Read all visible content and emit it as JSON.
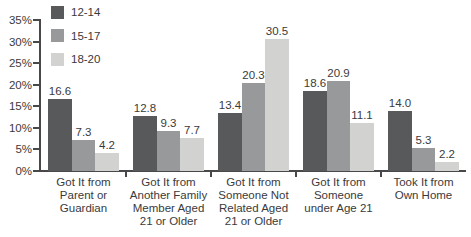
{
  "chart_data": {
    "type": "bar",
    "title": "",
    "xlabel": "",
    "ylabel": "",
    "ylim": [
      0,
      35
    ],
    "ytick_step": 5,
    "ytick_labels": [
      "0%",
      "5%",
      "10%",
      "15%",
      "20%",
      "25%",
      "30%",
      "35%"
    ],
    "grid": false,
    "legend_position": "top-left",
    "categories": [
      "Got It from\nParent or\nGuardian",
      "Got It from\nAnother Family\nMember Aged\n21 or Older",
      "Got It from\nSomeone Not\nRelated Aged\n21 or Older",
      "Got It from\nSomeone\nunder Age 21",
      "Took It from\nOwn Home"
    ],
    "series": [
      {
        "name": "12-14",
        "color": "#58595b",
        "values": [
          16.6,
          12.8,
          13.4,
          18.6,
          14.0
        ],
        "labels": [
          "16.6",
          "12.8",
          "13.4",
          "18.6",
          "14.0"
        ]
      },
      {
        "name": "15-17",
        "color": "#98999b",
        "values": [
          7.3,
          9.3,
          20.3,
          20.9,
          5.3
        ],
        "labels": [
          "7.3",
          "9.3",
          "20.3",
          "20.9",
          "5.3"
        ]
      },
      {
        "name": "18-20",
        "color": "#d2d3d0",
        "values": [
          4.2,
          7.7,
          30.5,
          11.1,
          2.2
        ],
        "labels": [
          "4.2",
          "7.7",
          "30.5",
          "11.1",
          "2.2"
        ]
      }
    ],
    "colors": {
      "axis": "#48484a",
      "text": "#3a3a3c",
      "background": "#ffffff"
    }
  }
}
